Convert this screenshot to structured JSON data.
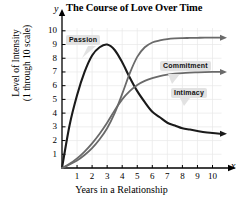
{
  "chart_data": {
    "type": "line",
    "title": "The Course of Love Over Time",
    "xlabel": "Years in a Relationship",
    "ylabel_line1": "Level of Intensity",
    "ylabel_line2": "(1 through 10 scale)",
    "x_axis_letter": "y",
    "y_axis_letter": "x",
    "xlim": [
      0,
      10.8
    ],
    "ylim": [
      0,
      10.4
    ],
    "xticks": [
      1,
      2,
      3,
      4,
      5,
      6,
      7,
      8,
      9,
      10
    ],
    "yticks": [
      1,
      2,
      3,
      4,
      5,
      6,
      7,
      8,
      9,
      10
    ],
    "grid": true,
    "legend_position": "inline-callouts",
    "x": [
      0,
      0.5,
      1,
      1.5,
      2,
      2.5,
      3,
      3.5,
      4,
      4.5,
      5,
      5.5,
      6,
      6.5,
      7,
      7.5,
      8,
      8.5,
      9,
      9.5,
      10,
      10.5
    ],
    "series": [
      {
        "name": "Passion",
        "color": "#1a1a1a",
        "values": [
          0,
          3.1,
          5.3,
          7.0,
          8.2,
          8.8,
          9.0,
          8.6,
          7.7,
          6.6,
          5.6,
          4.8,
          4.1,
          3.7,
          3.3,
          3.1,
          2.9,
          2.8,
          2.7,
          2.6,
          2.55,
          2.5
        ],
        "peak_x": 3,
        "peak_y": 9,
        "end_value": 2.5,
        "arrow_end": true
      },
      {
        "name": "Commitment",
        "color": "#6a6a6a",
        "values": [
          0,
          0.25,
          0.55,
          0.95,
          1.45,
          2.1,
          2.9,
          4.0,
          5.4,
          6.9,
          8.1,
          8.8,
          9.15,
          9.3,
          9.4,
          9.45,
          9.47,
          9.48,
          9.49,
          9.5,
          9.5,
          9.5
        ],
        "end_value": 9.5,
        "arrow_end": true
      },
      {
        "name": "Intimacy",
        "color": "#6a6a6a",
        "values": [
          0,
          0.3,
          0.7,
          1.2,
          1.8,
          2.5,
          3.3,
          4.2,
          5.0,
          5.6,
          6.05,
          6.35,
          6.55,
          6.7,
          6.8,
          6.87,
          6.92,
          6.95,
          6.97,
          6.99,
          7.0,
          7.0
        ],
        "end_value": 7.0,
        "arrow_end": true
      }
    ],
    "annotations": [
      {
        "label": "Passion",
        "series": "Passion"
      },
      {
        "label": "Commitment",
        "series": "Commitment"
      },
      {
        "label": "Intimacy",
        "series": "Intimacy"
      }
    ]
  }
}
